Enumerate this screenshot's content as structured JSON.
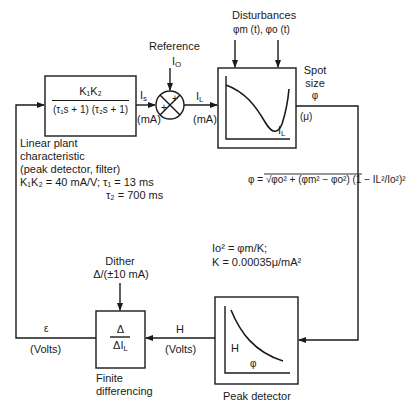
{
  "diagram": {
    "type": "block-diagram-feedback-loop",
    "reference": {
      "label": "Reference",
      "signal": "I",
      "signal_sub": "O"
    },
    "disturbances": {
      "label": "Disturbances",
      "signals": "φm (t), φo (t)"
    },
    "plant_block": {
      "numerator": "K₁K₂",
      "denominator": "(τ₁s + 1) (τ₂s + 1)",
      "caption_lines": [
        "Linear plant",
        "characteristic",
        "(peak detector, filter)"
      ],
      "params_line1": "K₁K₂ = 40 mA/V; τ₁ = 13 ms",
      "params_line2": "τ₂ = 700 ms"
    },
    "plant_output": {
      "signal": "I",
      "signal_sub": "s",
      "unit": "(mA)"
    },
    "summing_junction": {
      "sign_top": "+",
      "sign_left": "+"
    },
    "junction_output": {
      "signal": "I",
      "signal_sub": "L",
      "unit": "(mA)"
    },
    "spot_size_block": {
      "x_axis_label": "I",
      "x_axis_sub": "L",
      "output_label_lines": [
        "Spot",
        "size",
        "φ"
      ],
      "output_unit": "(μ)"
    },
    "spot_equation": "φ = √φo² + (φm² − φo²) (1 − IL²/Io²)²",
    "constants": {
      "line1": "Io² = φm/K;",
      "line2": "K = 0.00035μ/mA²"
    },
    "peak_detector_block": {
      "y_axis_label": "H",
      "x_axis_label": "φ",
      "caption": "Peak detector"
    },
    "peak_output": {
      "signal": "H",
      "unit": "(Volts)"
    },
    "dither": {
      "label": "Dither",
      "value": "Δ/(±10 mA)"
    },
    "finite_diff_block": {
      "numerator": "Δ",
      "denominator": "ΔI",
      "denominator_sub": "L",
      "caption_lines": [
        "Finite",
        "differencing"
      ]
    },
    "error_output": {
      "signal": "ε",
      "unit": "(Volts)"
    }
  }
}
